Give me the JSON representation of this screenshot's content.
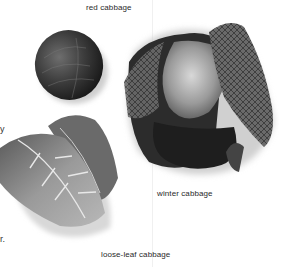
{
  "captions": {
    "red_cabbage": "red cabbage",
    "winter_cabbage": "winter cabbage",
    "loose_leaf_cabbage": "loose-leaf cabbage"
  },
  "clipped_text": {
    "fragment_1": "y",
    "fragment_2": "r."
  },
  "images": [
    {
      "name": "red cabbage",
      "description": "round dark red cabbage head"
    },
    {
      "name": "winter cabbage",
      "description": "savoy-style cabbage with crinkled outer leaves"
    },
    {
      "name": "loose-leaf cabbage",
      "description": "loose pale green leaves with white veins"
    }
  ],
  "colors": {
    "background": "#ffffff",
    "caption_text": "#2a2a2a"
  }
}
